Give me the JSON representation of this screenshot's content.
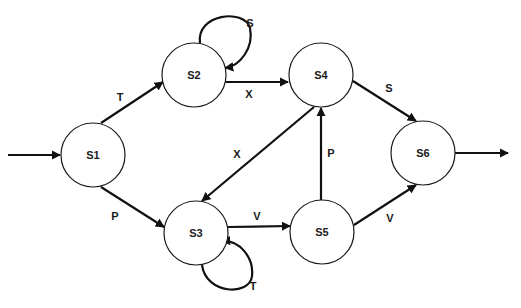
{
  "diagram": {
    "type": "state-transition",
    "states": [
      {
        "id": "S1",
        "label": "S1",
        "cx": 93,
        "cy": 155
      },
      {
        "id": "S2",
        "label": "S2",
        "cx": 194,
        "cy": 75
      },
      {
        "id": "S3",
        "label": "S3",
        "cx": 196,
        "cy": 233
      },
      {
        "id": "S4",
        "label": "S4",
        "cx": 321,
        "cy": 75
      },
      {
        "id": "S5",
        "label": "S5",
        "cx": 322,
        "cy": 232
      },
      {
        "id": "S6",
        "label": "S6",
        "cx": 423,
        "cy": 153
      }
    ],
    "radius": 32,
    "transitions": [
      {
        "from": "start",
        "to": "S1",
        "label": ""
      },
      {
        "from": "S1",
        "to": "S2",
        "label": "T"
      },
      {
        "from": "S1",
        "to": "S3",
        "label": "P"
      },
      {
        "from": "S2",
        "to": "S2",
        "label": "S"
      },
      {
        "from": "S2",
        "to": "S4",
        "label": "X"
      },
      {
        "from": "S3",
        "to": "S3",
        "label": "T"
      },
      {
        "from": "S3",
        "to": "S5",
        "label": "V"
      },
      {
        "from": "S4",
        "to": "S3",
        "label": "X"
      },
      {
        "from": "S4",
        "to": "S6",
        "label": "S"
      },
      {
        "from": "S5",
        "to": "S4",
        "label": "P"
      },
      {
        "from": "S5",
        "to": "S6",
        "label": "V"
      },
      {
        "from": "S6",
        "to": "end",
        "label": ""
      }
    ]
  }
}
